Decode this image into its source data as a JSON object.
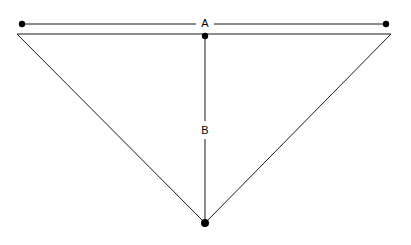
{
  "canvas": {
    "width": 411,
    "height": 245,
    "background": "#ffffff"
  },
  "figure": {
    "stroke_color": "#1a1a1a",
    "marker_color": "#000000",
    "label_color": "#000000",
    "stroke_width": 1,
    "marker_radius": 3.2
  },
  "shape": {
    "name": "triangle",
    "type": "polygon",
    "orientation": "inverted",
    "vertices": [
      {
        "name": "top-left",
        "x": 17,
        "y": 34
      },
      {
        "name": "top-right",
        "x": 391,
        "y": 34
      },
      {
        "name": "bottom-apex",
        "x": 205,
        "y": 223
      }
    ]
  },
  "dimensions": [
    {
      "id": "A",
      "label": "A",
      "kind": "width",
      "orientation": "horizontal",
      "label_x": 205,
      "label_y": 23,
      "gap_half_width": 9,
      "line": {
        "x1": 22,
        "y1": 24,
        "x2": 386,
        "y2": 24
      },
      "endpoints": [
        {
          "name": "dimension-a-start-dot",
          "x": 22,
          "y": 24
        },
        {
          "name": "dimension-a-end-dot",
          "x": 386,
          "y": 24
        }
      ]
    },
    {
      "id": "B",
      "label": "B",
      "kind": "height",
      "orientation": "vertical",
      "label_x": 205,
      "label_y": 130,
      "gap_half_height": 9,
      "line": {
        "x1": 205,
        "y1": 36,
        "x2": 205,
        "y2": 223
      },
      "endpoints": [
        {
          "name": "dimension-b-start-dot",
          "x": 205,
          "y": 36
        },
        {
          "name": "dimension-b-end-dot",
          "x": 205,
          "y": 223
        }
      ]
    }
  ]
}
